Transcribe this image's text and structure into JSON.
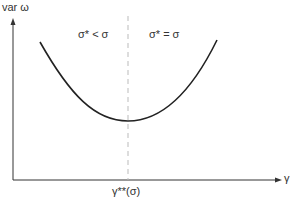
{
  "diagram": {
    "y_axis_label": "var ω",
    "x_axis_label": "γ",
    "x_marker_label": "γ**(σ)",
    "region_left_label": "σ* < σ",
    "region_right_label": "σ* = σ",
    "curve": {
      "shape": "U-shaped",
      "start": [
        40,
        42
      ],
      "minimum": [
        128,
        121
      ],
      "end": [
        217,
        40
      ]
    },
    "colors": {
      "axis": "#333333",
      "curve": "#222222",
      "dashed_line": "#bbbbbb"
    }
  }
}
